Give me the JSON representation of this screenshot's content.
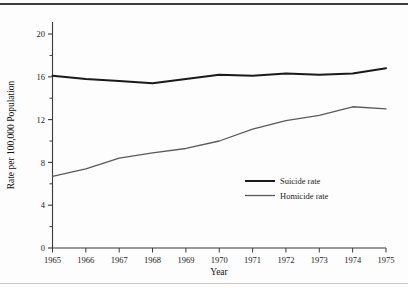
{
  "chart_data": {
    "type": "line",
    "title": "",
    "xlabel": "Year",
    "ylabel": "Rate per 100,000 Population",
    "x": [
      1965,
      1966,
      1967,
      1968,
      1969,
      1970,
      1971,
      1972,
      1973,
      1974,
      1975
    ],
    "categories": [
      "1965",
      "1966",
      "1967",
      "1968",
      "1969",
      "1970",
      "1971",
      "1972",
      "1973",
      "1974",
      "1975"
    ],
    "xlim": [
      1965,
      1975
    ],
    "ylim": [
      0,
      20
    ],
    "yticks": [
      0,
      4,
      8,
      12,
      16,
      20
    ],
    "ytick_labels": [
      "0",
      "4",
      "8",
      "12",
      "16",
      "20"
    ],
    "yminor_ticks": [
      2,
      6,
      10,
      14,
      18
    ],
    "grid": false,
    "legend_position": "center-right",
    "series": [
      {
        "name": "Suicide rate",
        "color": "#1a1a1a",
        "width": 2.0,
        "values": [
          16.1,
          15.8,
          15.6,
          15.4,
          15.8,
          16.2,
          16.1,
          16.3,
          16.2,
          16.3,
          16.8
        ]
      },
      {
        "name": "Homicide rate",
        "color": "#5a5a5a",
        "width": 1.3,
        "values": [
          6.7,
          7.4,
          8.4,
          8.9,
          9.3,
          10.0,
          11.1,
          11.9,
          12.4,
          13.2,
          13.0
        ]
      }
    ]
  },
  "legend": {
    "items": [
      {
        "label": "Suicide rate"
      },
      {
        "label": "Homicide rate"
      }
    ]
  },
  "axes": {
    "x_title": "Year",
    "y_title": "Rate per 100,000 Population"
  }
}
